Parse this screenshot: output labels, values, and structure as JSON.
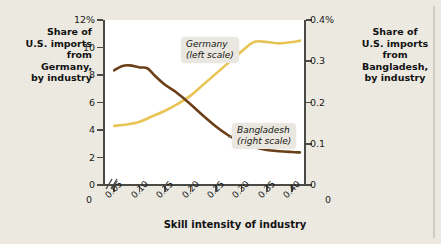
{
  "left_heading": "Share of\nU.S. imports\nfrom\nGermany,\nby industry",
  "right_heading": "Share of\nU.S. imports\nfrom\nBangladesh,\nby industry",
  "x_axis_title": "Skill intensity of industry",
  "x_zero_left": "0",
  "x_zero_right": "0",
  "callouts": {
    "germany": "Germany\n(left scale)",
    "bangladesh": "Bangladesh\n(right scale)"
  },
  "colors": {
    "germany_line": "#e8c455",
    "bangladesh_line": "#6b4019",
    "background": "#efece4",
    "plot_background": "#ffffff",
    "axis": "#4a4a46",
    "callout_background": "#e9e7df",
    "text": "#121212"
  },
  "chart_data": {
    "type": "line",
    "title": "",
    "xlabel": "Skill intensity of industry",
    "grid": false,
    "legend_position": "inline-callouts",
    "x_tick_labels": [
      "0.05",
      "0.10",
      "0.15",
      "0.20",
      "0.25",
      "0.30",
      "0.35",
      "0.40"
    ],
    "x_ticks": [
      0.05,
      0.1,
      0.15,
      0.2,
      0.25,
      0.3,
      0.35,
      0.4
    ],
    "xlim": [
      0.03,
      0.425
    ],
    "x_axis_break": true,
    "axes": [
      {
        "side": "left",
        "label": "Share of U.S. imports from Germany, by industry",
        "ylim": [
          0,
          12
        ],
        "ticks": [
          0,
          2,
          4,
          6,
          8,
          10,
          12
        ],
        "tick_labels": [
          "0",
          "2",
          "4",
          "6",
          "8",
          "10",
          "12%"
        ]
      },
      {
        "side": "right",
        "label": "Share of U.S. imports from Bangladesh, by industry",
        "ylim": [
          0,
          0.4
        ],
        "ticks": [
          0,
          0.1,
          0.2,
          0.3,
          0.4
        ],
        "tick_labels": [
          "0",
          "0.1",
          "0.2",
          "0.3",
          "0.4%"
        ]
      }
    ],
    "series": [
      {
        "name": "Germany (left scale)",
        "axis": "left",
        "color": "#e8c455",
        "x": [
          0.05,
          0.075,
          0.1,
          0.125,
          0.15,
          0.175,
          0.2,
          0.225,
          0.25,
          0.275,
          0.3,
          0.325,
          0.35,
          0.375,
          0.4,
          0.415
        ],
        "values": [
          4.3,
          4.4,
          4.6,
          5.0,
          5.4,
          5.9,
          6.5,
          7.3,
          8.1,
          8.9,
          9.7,
          10.4,
          10.4,
          10.3,
          10.4,
          10.5
        ]
      },
      {
        "name": "Bangladesh (right scale)",
        "axis": "right",
        "color": "#6b4019",
        "x": [
          0.05,
          0.065,
          0.08,
          0.1,
          0.115,
          0.13,
          0.15,
          0.175,
          0.2,
          0.225,
          0.25,
          0.275,
          0.3,
          0.325,
          0.35,
          0.375,
          0.4,
          0.415
        ],
        "values": [
          0.278,
          0.288,
          0.29,
          0.285,
          0.283,
          0.265,
          0.243,
          0.222,
          0.196,
          0.168,
          0.142,
          0.12,
          0.103,
          0.092,
          0.085,
          0.082,
          0.08,
          0.079
        ]
      }
    ]
  }
}
